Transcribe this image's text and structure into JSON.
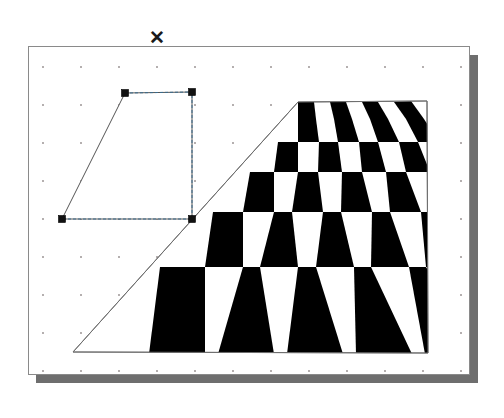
{
  "window": {
    "background_color": "#ffffff",
    "cursor_marker_glyph": "✕",
    "cursor_marker_name": "close-x-marker"
  },
  "canvas": {
    "title": "",
    "x": 28,
    "y": 46,
    "width": 442,
    "height": 329,
    "background_color": "#ffffff",
    "border_color": "#8a8a8a",
    "shadow_color": "#6e6e6e",
    "grid": {
      "visible": true,
      "spacing_px": 38,
      "dot_color": "#7a7070"
    }
  },
  "selection": {
    "label": "Selected quadrilateral",
    "shape": "trapezoid",
    "outline_color": "#555555",
    "marquee_color": "#3a6b8c",
    "marquee_style": "dashed",
    "handle_color": "#111111",
    "handle_size_px": 7,
    "points": [
      {
        "name": "top-left-handle",
        "x": 96,
        "y": 46
      },
      {
        "name": "top-right-handle",
        "x": 163,
        "y": 45
      },
      {
        "name": "bottom-right-handle",
        "x": 163,
        "y": 172
      },
      {
        "name": "bottom-left-handle",
        "x": 33,
        "y": 172
      }
    ]
  },
  "checkerboard": {
    "label": "Perspective checkerboard plane",
    "color_dark": "#000000",
    "color_light": "#ffffff",
    "outline_color": "#6f6f6f",
    "columns": 8,
    "rows": 6,
    "corners": {
      "far_left": {
        "x": 269,
        "y": 55
      },
      "far_right": {
        "x": 398,
        "y": 54
      },
      "near_right": {
        "x": 399,
        "y": 306
      },
      "near_left": {
        "x": 44,
        "y": 305
      }
    }
  }
}
